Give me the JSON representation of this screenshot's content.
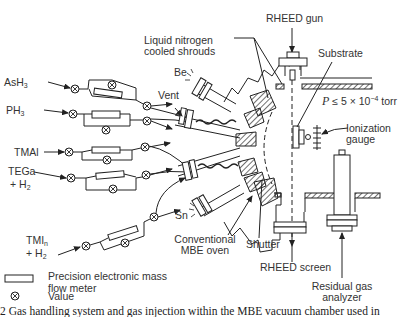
{
  "diagram": {
    "type": "Gas-source MBE system schematic",
    "gas_sources": [
      {
        "id": "ash3",
        "label": "AsH",
        "sub": "3",
        "line2": ""
      },
      {
        "id": "ph3",
        "label": "PH",
        "sub": "3",
        "line2": ""
      },
      {
        "id": "tmal",
        "label": "TMAl",
        "sub": "",
        "line2": ""
      },
      {
        "id": "tega",
        "label": "TEGa",
        "sub": "",
        "line2": "+ H",
        "line2_sub": "2"
      },
      {
        "id": "tmin",
        "label": "TMI",
        "sub": "n",
        "line2": "+ H",
        "line2_sub": "2"
      }
    ],
    "labels": {
      "vent": "Vent",
      "be": "Be",
      "sn": "Sn",
      "shrouds_line1": "Liquid nitrogen",
      "shrouds_line2": "cooled shrouds",
      "rheed_gun": "RHEED gun",
      "substrate": "Substrate",
      "pressure_prefix": "P",
      "pressure_rel": "≤ 5 × 10",
      "pressure_exp": "−4",
      "pressure_unit": " torr",
      "ionization_line1": "Ionization",
      "ionization_line2": "gauge",
      "mbe_oven_line1": "Conventional",
      "mbe_oven_line2": "MBE oven",
      "shutter": "Shutter",
      "rheed_screen": "RHEED screen",
      "rga_line1": "Residual gas",
      "rga_line2": "analyzer"
    },
    "legend": {
      "items": [
        {
          "icon": "mass-flow-meter-rectangle",
          "text_line1": "Precision electronic mass",
          "text_line2": "flow meter"
        },
        {
          "icon": "valve-circle-x",
          "text_line1": "Value",
          "text_line2": ""
        }
      ]
    },
    "caption": "2  Gas handling system and gas injection within the MBE vacuum chamber used in"
  }
}
